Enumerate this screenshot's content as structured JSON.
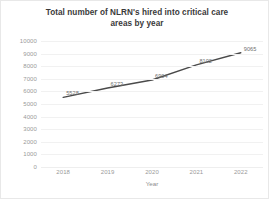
{
  "chart_data": {
    "type": "line",
    "title": "Total number of NLRN's hired into critical care areas by year",
    "title_line1": "Total number of NLRN's hired into critical care",
    "title_line2": "areas by year",
    "xlabel": "Year",
    "ylabel": "",
    "categories": [
      "2018",
      "2019",
      "2020",
      "2021",
      "2022"
    ],
    "values": [
      5528,
      6273,
      6904,
      8102,
      9065
    ],
    "point_labels": [
      "5528",
      "6273",
      "6904",
      "8102",
      "9065"
    ],
    "ylim": [
      0,
      10000
    ],
    "ytick_labels": [
      "0",
      "1000",
      "2000",
      "3000",
      "4000",
      "5000",
      "6000",
      "7000",
      "8000",
      "9000",
      "10000"
    ],
    "ytick_values": [
      0,
      1000,
      2000,
      3000,
      4000,
      5000,
      6000,
      7000,
      8000,
      9000,
      10000
    ],
    "grid": "horizontal",
    "legend": "none",
    "series_color": "#4a4a4a",
    "grid_color": "#f1f1f1",
    "tick_text_color": "#9a9a9a",
    "title_color": "#3a3a3a",
    "background_color": "#ffffff"
  }
}
